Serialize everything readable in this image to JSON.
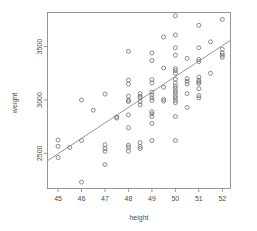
{
  "chart_data": {
    "type": "scatter",
    "title": "",
    "subtitle": "",
    "xlabel": "height",
    "ylabel": "weight",
    "xlim": [
      44.55,
      52.35
    ],
    "ylim": [
      2170,
      3820
    ],
    "grid": false,
    "legend": null,
    "x_ticks": [
      45,
      46,
      47,
      48,
      49,
      50,
      51,
      52
    ],
    "x_tick_labels": [
      "45",
      "46",
      "47",
      "48",
      "49",
      "50",
      "51",
      "52"
    ],
    "y_ticks": [
      2500,
      3000,
      3500
    ],
    "y_tick_labels": [
      "2500",
      "3000",
      "3500"
    ],
    "marker": "open-circle",
    "marker_color": "#6f6f6f",
    "frame_color": "#8c8c8c",
    "text_color": "#4d4d4d",
    "background": "#ffffff",
    "annotations": [],
    "trendline": {
      "type": "linear-fit",
      "color": "#8a8a8a",
      "x_start": 44.55,
      "y_start": 2430,
      "x_end": 52.35,
      "y_end": 3560
    },
    "points": [
      {
        "x": 45.0,
        "y": 2625
      },
      {
        "x": 45.0,
        "y": 2565
      },
      {
        "x": 45.0,
        "y": 2460
      },
      {
        "x": 45.5,
        "y": 2555
      },
      {
        "x": 46.0,
        "y": 3000
      },
      {
        "x": 46.0,
        "y": 2620
      },
      {
        "x": 46.0,
        "y": 2230
      },
      {
        "x": 46.5,
        "y": 2905
      },
      {
        "x": 47.0,
        "y": 3055
      },
      {
        "x": 47.0,
        "y": 2580
      },
      {
        "x": 47.0,
        "y": 2545
      },
      {
        "x": 47.0,
        "y": 2520
      },
      {
        "x": 47.0,
        "y": 2395
      },
      {
        "x": 47.5,
        "y": 2840
      },
      {
        "x": 47.5,
        "y": 2830
      },
      {
        "x": 48.0,
        "y": 3455
      },
      {
        "x": 48.0,
        "y": 3185
      },
      {
        "x": 48.0,
        "y": 3150
      },
      {
        "x": 48.0,
        "y": 3035
      },
      {
        "x": 48.0,
        "y": 3000
      },
      {
        "x": 48.0,
        "y": 2985
      },
      {
        "x": 48.0,
        "y": 2860
      },
      {
        "x": 48.0,
        "y": 2740
      },
      {
        "x": 48.0,
        "y": 2575
      },
      {
        "x": 48.0,
        "y": 2555
      },
      {
        "x": 48.0,
        "y": 2520
      },
      {
        "x": 48.5,
        "y": 3060
      },
      {
        "x": 48.5,
        "y": 3035
      },
      {
        "x": 48.5,
        "y": 3020
      },
      {
        "x": 48.5,
        "y": 2985
      },
      {
        "x": 48.5,
        "y": 2955
      },
      {
        "x": 48.5,
        "y": 2600
      },
      {
        "x": 48.5,
        "y": 2565
      },
      {
        "x": 48.5,
        "y": 2545
      },
      {
        "x": 49.0,
        "y": 3440
      },
      {
        "x": 49.0,
        "y": 3370
      },
      {
        "x": 49.0,
        "y": 3190
      },
      {
        "x": 49.0,
        "y": 3160
      },
      {
        "x": 49.0,
        "y": 3075
      },
      {
        "x": 49.0,
        "y": 3045
      },
      {
        "x": 49.0,
        "y": 3020
      },
      {
        "x": 49.0,
        "y": 2995
      },
      {
        "x": 49.0,
        "y": 2890
      },
      {
        "x": 49.0,
        "y": 2870
      },
      {
        "x": 49.0,
        "y": 2845
      },
      {
        "x": 49.0,
        "y": 2780
      },
      {
        "x": 49.0,
        "y": 2620
      },
      {
        "x": 49.5,
        "y": 3590
      },
      {
        "x": 49.5,
        "y": 3300
      },
      {
        "x": 49.5,
        "y": 3120
      },
      {
        "x": 49.5,
        "y": 3005
      },
      {
        "x": 49.5,
        "y": 2990
      },
      {
        "x": 50.0,
        "y": 3790
      },
      {
        "x": 50.0,
        "y": 3610
      },
      {
        "x": 50.0,
        "y": 3490
      },
      {
        "x": 50.0,
        "y": 3420
      },
      {
        "x": 50.0,
        "y": 3295
      },
      {
        "x": 50.0,
        "y": 3275
      },
      {
        "x": 50.0,
        "y": 3250
      },
      {
        "x": 50.0,
        "y": 3195
      },
      {
        "x": 50.0,
        "y": 3160
      },
      {
        "x": 50.0,
        "y": 3130
      },
      {
        "x": 50.0,
        "y": 3110
      },
      {
        "x": 50.0,
        "y": 3085
      },
      {
        "x": 50.0,
        "y": 3065
      },
      {
        "x": 50.0,
        "y": 3040
      },
      {
        "x": 50.0,
        "y": 3020
      },
      {
        "x": 50.0,
        "y": 2995
      },
      {
        "x": 50.0,
        "y": 2975
      },
      {
        "x": 50.0,
        "y": 2845
      },
      {
        "x": 50.0,
        "y": 2620
      },
      {
        "x": 50.5,
        "y": 3390
      },
      {
        "x": 50.5,
        "y": 3200
      },
      {
        "x": 50.5,
        "y": 3175
      },
      {
        "x": 50.5,
        "y": 3150
      },
      {
        "x": 50.5,
        "y": 3060
      },
      {
        "x": 50.5,
        "y": 2930
      },
      {
        "x": 51.0,
        "y": 3700
      },
      {
        "x": 51.0,
        "y": 3490
      },
      {
        "x": 51.0,
        "y": 3380
      },
      {
        "x": 51.0,
        "y": 3360
      },
      {
        "x": 51.0,
        "y": 3215
      },
      {
        "x": 51.0,
        "y": 3185
      },
      {
        "x": 51.0,
        "y": 3170
      },
      {
        "x": 51.0,
        "y": 3155
      },
      {
        "x": 51.0,
        "y": 3105
      },
      {
        "x": 51.0,
        "y": 3040
      },
      {
        "x": 51.0,
        "y": 3020
      },
      {
        "x": 51.5,
        "y": 3545
      },
      {
        "x": 51.5,
        "y": 3250
      },
      {
        "x": 52.0,
        "y": 3755
      },
      {
        "x": 52.0,
        "y": 3475
      },
      {
        "x": 52.0,
        "y": 3440
      },
      {
        "x": 52.0,
        "y": 3420
      },
      {
        "x": 52.0,
        "y": 3400
      }
    ]
  }
}
